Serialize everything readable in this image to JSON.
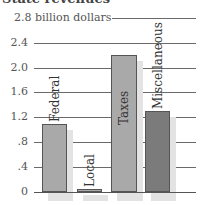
{
  "chart_data": {
    "type": "bar",
    "title": "State revenues",
    "ylabel": "billion dollars",
    "categories": [
      "Federal",
      "Local",
      "Taxes",
      "Miscellaneous"
    ],
    "values": [
      1.1,
      0.05,
      2.2,
      1.3
    ],
    "ylim": [
      0,
      2.8
    ],
    "yticks": [
      "0",
      ".4",
      ".8",
      "1.2",
      "1.6",
      "2.0",
      "2.4",
      "2.8 billion dollars"
    ],
    "grid": true,
    "legend": "none",
    "colors": [
      "#a9a9a9",
      "#a9a9a9",
      "#a9a9a9",
      "#7b7b7b"
    ]
  }
}
